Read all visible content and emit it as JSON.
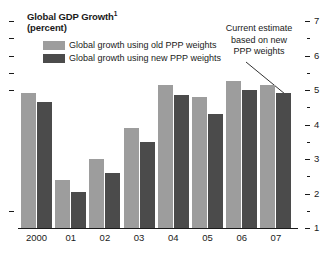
{
  "chart_data": {
    "type": "bar",
    "title": "Global GDP Growth",
    "title_superscript": "1",
    "subtitle": "(percent)",
    "xlabel": "",
    "ylabel": "",
    "ylim": [
      1,
      7
    ],
    "y_ticks": [
      1,
      2,
      3,
      4,
      5,
      6,
      7
    ],
    "y_minor_ticks": [
      1.5,
      2.5,
      3.5,
      4.5,
      5.5,
      6.5
    ],
    "y_axis_position": "right",
    "grid": false,
    "legend_position": "top-left",
    "categories": [
      "2000",
      "01",
      "02",
      "03",
      "04",
      "05",
      "06",
      "07"
    ],
    "series": [
      {
        "name": "Global growth using old PPP weights",
        "color": "#9d9d9d",
        "values": [
          4.9,
          2.4,
          3.0,
          3.9,
          5.15,
          4.8,
          5.25,
          5.15
        ]
      },
      {
        "name": "Global growth using new PPP weights",
        "color": "#4b4b4b",
        "values": [
          4.65,
          2.05,
          2.6,
          3.5,
          4.85,
          4.3,
          5.0,
          4.9
        ]
      }
    ],
    "annotations": [
      {
        "text": "Current estimate based on new PPP weights",
        "lines": [
          "Current estimate",
          "based on new",
          "PPP weights"
        ],
        "points_to": "07 new PPP weights bar"
      }
    ]
  },
  "colors": {
    "series_old": "#9d9d9d",
    "series_new": "#4b4b4b",
    "axis": "#1a1a1a",
    "background": "#ffffff"
  }
}
